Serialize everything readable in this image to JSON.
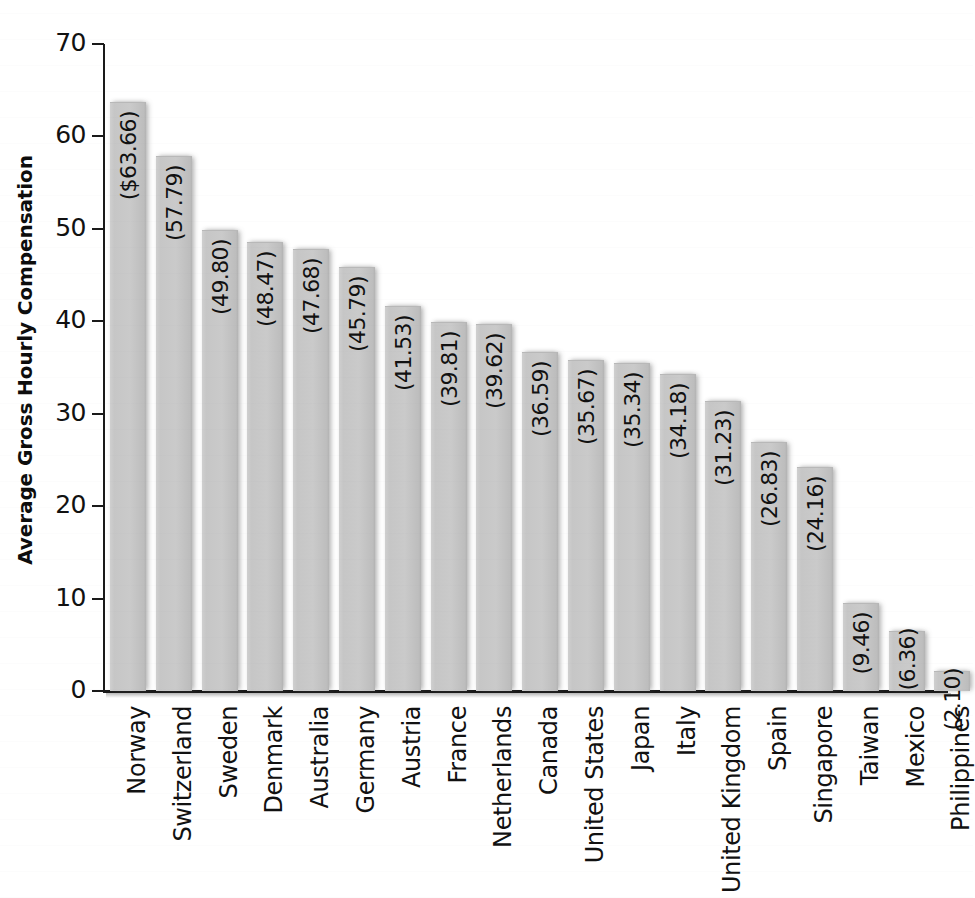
{
  "chart_data": {
    "type": "bar",
    "title": "",
    "xlabel": "",
    "ylabel": "Average Gross Hourly Compensation",
    "ylim": [
      0,
      70
    ],
    "ytick_step": 10,
    "yticks": [
      "70",
      "60",
      "50",
      "40",
      "30",
      "20",
      "10",
      "0"
    ],
    "grid": false,
    "legend": false,
    "orientation": "vertical",
    "bar_color": "#c9c9c9",
    "categories": [
      "Norway",
      "Switzerland",
      "Sweden",
      "Denmark",
      "Australia",
      "Germany",
      "Austria",
      "France",
      "Netherlands",
      "Canada",
      "United States",
      "Japan",
      "Italy",
      "United Kingdom",
      "Spain",
      "Singapore",
      "Taiwan",
      "Mexico",
      "Philippines"
    ],
    "values": [
      63.66,
      57.79,
      49.8,
      48.47,
      47.68,
      45.79,
      41.53,
      39.81,
      39.62,
      36.59,
      35.67,
      35.34,
      34.18,
      31.23,
      26.83,
      24.16,
      9.46,
      6.36,
      2.1
    ],
    "data_labels": [
      "($63.66)",
      "(57.79)",
      "(49.80)",
      "(48.47)",
      "(47.68)",
      "(45.79)",
      "(41.53)",
      "(39.81)",
      "(39.62)",
      "(36.59)",
      "(35.67)",
      "(35.34)",
      "(34.18)",
      "(31.23)",
      "(26.83)",
      "(24.16)",
      "(9.46)",
      "(6.36)",
      "(2.10)"
    ]
  }
}
